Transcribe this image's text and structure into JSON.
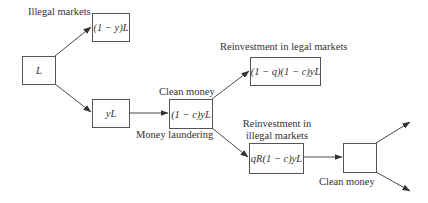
{
  "diagram": {
    "type": "flowchart",
    "nodes": {
      "start": {
        "text": "L"
      },
      "illegal": {
        "text": "(1 − y)L"
      },
      "laundered_input": {
        "text": "yL"
      },
      "clean": {
        "text": "(1 − c)yL"
      },
      "legal_reinvest": {
        "text": "(1 − q)(1 − c)yL"
      },
      "illegal_reinvest": {
        "text": "qR(1 − c)yL"
      },
      "final": {
        "text": ""
      }
    },
    "labels": {
      "illegal_markets": "Illegal markets",
      "clean_money_top": "Clean money",
      "money_laundering": "Money laundering",
      "reinvest_legal": "Reinvestment in legal markets",
      "reinvest_illegal_line1": "Reinvestment in",
      "reinvest_illegal_line2": "illegal markets",
      "clean_money_bottom": "Clean money"
    },
    "edges": [
      {
        "from": "start",
        "to": "illegal"
      },
      {
        "from": "start",
        "to": "laundered_input"
      },
      {
        "from": "laundered_input",
        "to": "clean"
      },
      {
        "from": "clean",
        "to": "legal_reinvest"
      },
      {
        "from": "clean",
        "to": "illegal_reinvest"
      },
      {
        "from": "illegal_reinvest",
        "to": "final"
      },
      {
        "from": "final",
        "to": "out-upper"
      },
      {
        "from": "final",
        "to": "out-lower"
      }
    ],
    "colors": {
      "line": "#333333",
      "box_border": "#555555",
      "background": "#ffffff"
    }
  }
}
